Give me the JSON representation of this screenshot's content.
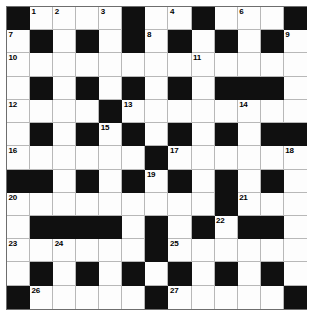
{
  "puzzle": {
    "type": "crossword-grid",
    "rows": 13,
    "columns": 13,
    "colors": {
      "block": "#101010",
      "cell": "#fdfdfd",
      "grid_line": "#b8b8b8",
      "border": "#6e6e6e",
      "number_text": "#000000"
    },
    "legend": {
      "block_char": "#",
      "open_char": "."
    },
    "grid": [
      "#....#..#...#",
      ".#.#.#.#.#.#.",
      ".............",
      ".#.#.#.#.###.",
      "....#........",
      ".#.#.#.#.#.##",
      "......#......",
      "##.#.#.#.#.#.",
      ".........#...",
      ".####.#.#.##.",
      "......#......",
      ".#.#.#.#.#.#.",
      "#.....#.....#"
    ],
    "numbers": [
      {
        "label": "1",
        "row": 0,
        "col": 1
      },
      {
        "label": "2",
        "row": 0,
        "col": 2
      },
      {
        "label": "3",
        "row": 0,
        "col": 4
      },
      {
        "label": "4",
        "row": 0,
        "col": 7
      },
      {
        "label": "5",
        "row": 0,
        "col": 8
      },
      {
        "label": "6",
        "row": 0,
        "col": 10
      },
      {
        "label": "7",
        "row": 1,
        "col": 0
      },
      {
        "label": "8",
        "row": 1,
        "col": 6
      },
      {
        "label": "9",
        "row": 1,
        "col": 12
      },
      {
        "label": "10",
        "row": 2,
        "col": 0
      },
      {
        "label": "11",
        "row": 2,
        "col": 8
      },
      {
        "label": "12",
        "row": 4,
        "col": 0
      },
      {
        "label": "13",
        "row": 4,
        "col": 5
      },
      {
        "label": "14",
        "row": 4,
        "col": 10
      },
      {
        "label": "15",
        "row": 5,
        "col": 4
      },
      {
        "label": "16",
        "row": 6,
        "col": 0
      },
      {
        "label": "17",
        "row": 6,
        "col": 7
      },
      {
        "label": "18",
        "row": 6,
        "col": 12
      },
      {
        "label": "19",
        "row": 7,
        "col": 6
      },
      {
        "label": "20",
        "row": 8,
        "col": 0
      },
      {
        "label": "21",
        "row": 8,
        "col": 10
      },
      {
        "label": "22",
        "row": 9,
        "col": 9
      },
      {
        "label": "23",
        "row": 10,
        "col": 0
      },
      {
        "label": "24",
        "row": 10,
        "col": 2
      },
      {
        "label": "25",
        "row": 10,
        "col": 7
      },
      {
        "label": "26",
        "row": 12,
        "col": 1
      },
      {
        "label": "27",
        "row": 12,
        "col": 7
      }
    ]
  }
}
